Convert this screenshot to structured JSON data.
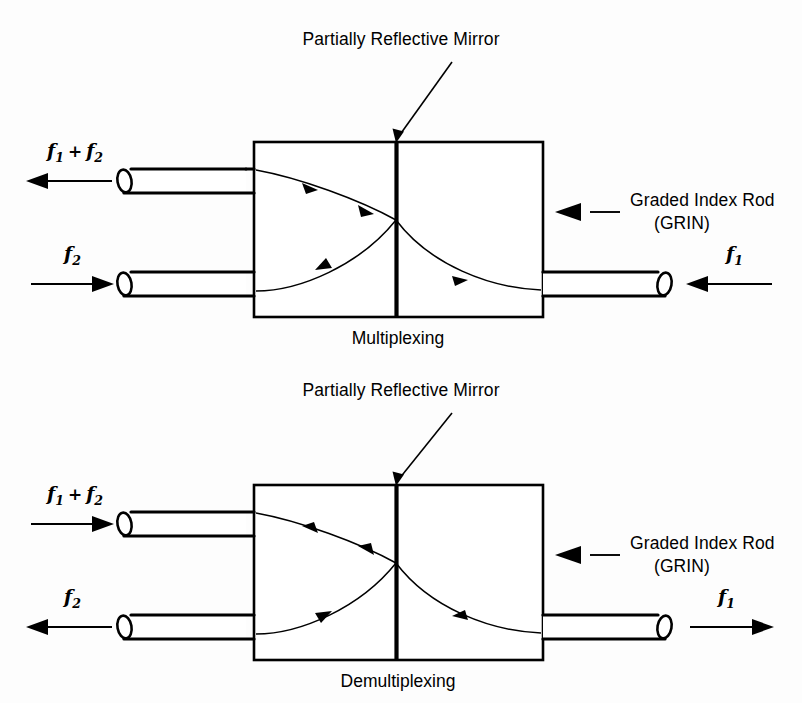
{
  "figure": {
    "background_color": "#fdfdfd",
    "line_color": "#000000"
  },
  "diagrams": [
    {
      "id": "multiplexing",
      "caption": "Multiplexing",
      "mirror_label": "Partially Reflective Mirror",
      "rod_label_line1": "Graded Index Rod",
      "rod_label_line2": "(GRIN)",
      "ports": [
        {
          "id": "mux-top-left",
          "signal_base": "f",
          "signal_sub_1": "1",
          "signal_op": "+",
          "signal_base_2": "f",
          "signal_sub_2": "2",
          "signal_text": "f1 + f2",
          "direction": "left",
          "side": "left",
          "position": "top"
        },
        {
          "id": "mux-bottom-left",
          "signal_base": "f",
          "signal_sub_1": "2",
          "signal_text": "f2",
          "direction": "right",
          "side": "left",
          "position": "bottom"
        },
        {
          "id": "mux-right",
          "signal_base": "f",
          "signal_sub_1": "1",
          "signal_text": "f1",
          "direction": "left",
          "side": "right",
          "position": "bottom"
        }
      ]
    },
    {
      "id": "demultiplexing",
      "caption": "Demultiplexing",
      "mirror_label": "Partially Reflective Mirror",
      "rod_label_line1": "Graded Index Rod",
      "rod_label_line2": "(GRIN)",
      "ports": [
        {
          "id": "demux-top-left",
          "signal_base": "f",
          "signal_sub_1": "1",
          "signal_op": "+",
          "signal_base_2": "f",
          "signal_sub_2": "2",
          "signal_text": "f1 + f2",
          "direction": "right",
          "side": "left",
          "position": "top"
        },
        {
          "id": "demux-bottom-left",
          "signal_base": "f",
          "signal_sub_1": "2",
          "signal_text": "f2",
          "direction": "left",
          "side": "left",
          "position": "bottom"
        },
        {
          "id": "demux-right",
          "signal_base": "f",
          "signal_sub_1": "1",
          "signal_text": "f1",
          "direction": "right",
          "side": "right",
          "position": "bottom"
        }
      ]
    }
  ]
}
